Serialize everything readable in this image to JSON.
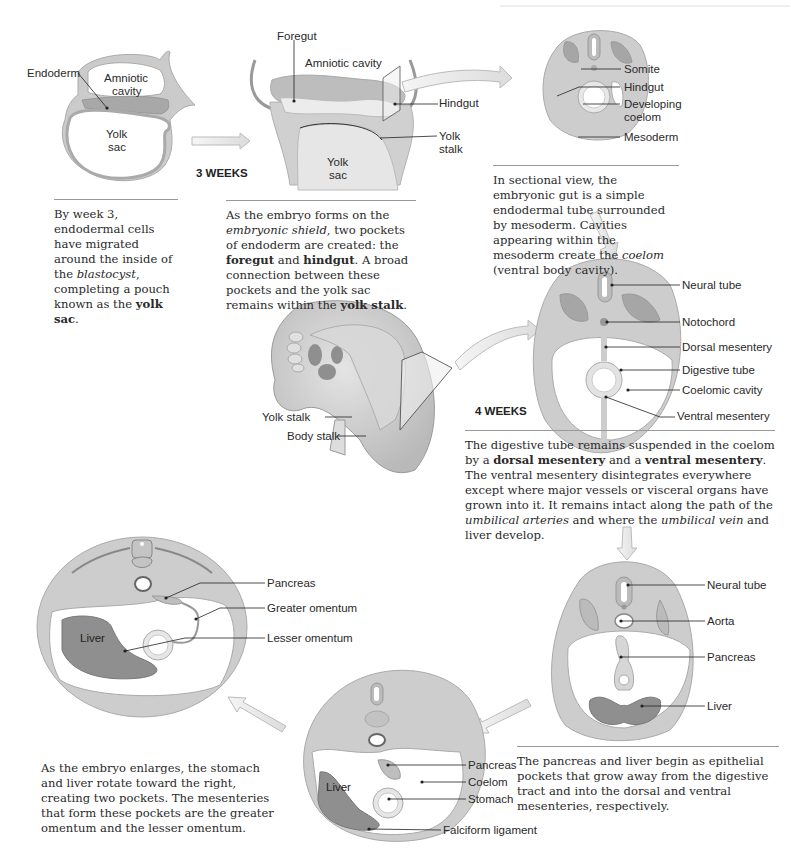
{
  "header": {
    "running_title": "EMBRYOLOGY SUMMARIES"
  },
  "stages": {
    "week3_label": "3 WEEKS",
    "week4_label": "4 WEEKS"
  },
  "panel1": {
    "labels": {
      "endoderm": "Endoderm",
      "amniotic_cavity_1": "Amniotic",
      "amniotic_cavity_2": "cavity",
      "yolk_sac_1": "Yolk",
      "yolk_sac_2": "sac"
    },
    "caption": [
      {
        "t": "By week 3, endodermal cells have migrated around the inside of the "
      },
      {
        "t": "blastocyst",
        "s": "i"
      },
      {
        "t": ", completing a pouch known as the "
      },
      {
        "t": "yolk sac",
        "s": "b"
      },
      {
        "t": "."
      }
    ]
  },
  "panel2": {
    "labels": {
      "foregut": "Foregut",
      "amniotic_cavity": "Amniotic cavity",
      "hindgut": "Hindgut",
      "yolk_stalk_1": "Yolk",
      "yolk_stalk_2": "stalk",
      "yolk_sac_1": "Yolk",
      "yolk_sac_2": "sac"
    },
    "caption": [
      {
        "t": "As the embryo forms on the "
      },
      {
        "t": "embryonic shield",
        "s": "i"
      },
      {
        "t": ", two pockets of endoderm are created: the "
      },
      {
        "t": "foregut",
        "s": "b"
      },
      {
        "t": " and "
      },
      {
        "t": "hindgut",
        "s": "b"
      },
      {
        "t": ". A broad connection between these pockets and the yolk sac remains within the "
      },
      {
        "t": "yolk stalk",
        "s": "b"
      },
      {
        "t": "."
      }
    ]
  },
  "panel3": {
    "labels": {
      "somite": "Somite",
      "hindgut": "Hindgut",
      "developing_coelom_1": "Developing",
      "developing_coelom_2": "coelom",
      "mesoderm": "Mesoderm"
    },
    "caption": [
      {
        "t": "In sectional view, the embryonic gut is a simple endodermal tube surrounded by mesoderm. Cavities appearing within the mesoderm create the "
      },
      {
        "t": "coelom",
        "s": "i"
      },
      {
        "t": " (ventral body cavity)."
      }
    ]
  },
  "panel4": {
    "labels": {
      "yolk_stalk": "Yolk stalk",
      "body_stalk": "Body stalk"
    }
  },
  "panel5": {
    "labels": {
      "neural_tube": "Neural tube",
      "notochord": "Notochord",
      "dorsal_mesentery": "Dorsal mesentery",
      "digestive_tube": "Digestive tube",
      "coelomic_cavity": "Coelomic cavity",
      "ventral_mesentery": "Ventral mesentery"
    },
    "caption": [
      {
        "t": "The digestive tube remains suspended in the coelom by a "
      },
      {
        "t": "dorsal mesentery",
        "s": "b"
      },
      {
        "t": " and a "
      },
      {
        "t": "ventral mesentery",
        "s": "b"
      },
      {
        "t": ". The ventral mesentery disintegrates everywhere except where major vessels or visceral organs have grown into it. It remains intact along the path of the "
      },
      {
        "t": "umbilical arteries",
        "s": "i"
      },
      {
        "t": " and where the "
      },
      {
        "t": "umbilical vein",
        "s": "i"
      },
      {
        "t": " and liver develop."
      }
    ]
  },
  "panel6": {
    "labels": {
      "neural_tube": "Neural tube",
      "aorta": "Aorta",
      "pancreas": "Pancreas",
      "liver": "Liver"
    },
    "caption": [
      {
        "t": "The pancreas and liver begin as epithelial pockets that grow away from the digestive tract and into the dorsal and ventral mesenteries, respectively."
      }
    ]
  },
  "panel7": {
    "labels": {
      "pancreas": "Pancreas",
      "coelom": "Coelom",
      "stomach": "Stomach",
      "liver": "Liver",
      "falciform_ligament": "Falciform ligament"
    }
  },
  "panel8": {
    "labels": {
      "pancreas": "Pancreas",
      "greater_omentum": "Greater omentum",
      "lesser_omentum": "Lesser omentum",
      "liver": "Liver"
    },
    "caption": [
      {
        "t": "As the embryo enlarges, the stomach and liver rotate toward the right, creating two pockets. The mesenteries that form these pockets are the greater omentum and the lesser omentum."
      }
    ]
  },
  "colors": {
    "tissue": "#c9c9c9",
    "tissue_edge": "#a9a9a9",
    "dark_tissue": "#8f8f8f",
    "cavity": "#ffffff",
    "arrow": "#e6e6e6",
    "arrow_edge": "#b5b5b5",
    "leader": "#222222"
  }
}
